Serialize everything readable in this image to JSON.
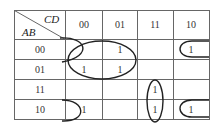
{
  "kmap": {
    "row_var": "AB",
    "col_var": "CD",
    "col_headers": [
      "00",
      "01",
      "11",
      "10"
    ],
    "row_headers": [
      "00",
      "01",
      "11",
      "10"
    ],
    "cells": [
      [
        "",
        "1",
        "",
        "1"
      ],
      [
        "1",
        "1",
        "",
        ""
      ],
      [
        "",
        "",
        "1",
        ""
      ],
      [
        "1",
        "",
        "1",
        "1"
      ]
    ],
    "groupings": [
      {
        "name": "group-ab0x-cd0x",
        "cells": "00-01 rows, 00-01 cols",
        "shape": "ellipse"
      },
      {
        "name": "group-corners-b0d0",
        "cells": "rows 00 & 10, cols 00 & 10 (wrap)",
        "shape": "half-loops"
      },
      {
        "name": "group-a1-cd11",
        "cells": "rows 11-10, col 11",
        "shape": "ellipse"
      }
    ],
    "line_color": "#555555",
    "loop_color": "#222222"
  }
}
